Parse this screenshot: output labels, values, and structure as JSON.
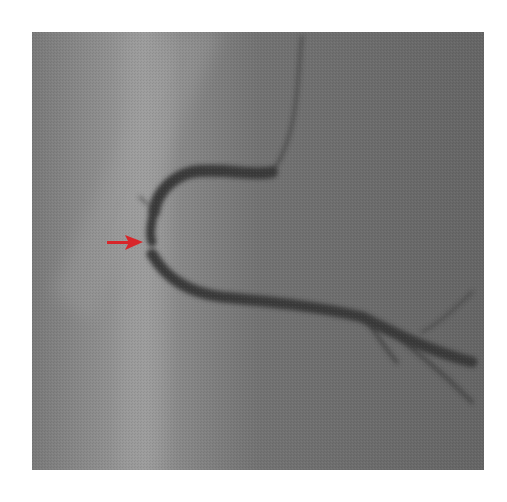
{
  "image": {
    "description": "Coronary angiogram (grayscale X-ray) with red arrow indicating a lesion",
    "colors": {
      "background": "#ffffff",
      "film": "#6e6e6e",
      "vessel": "#3a3a3a",
      "arrow": "#d8262a"
    },
    "annotation": {
      "type": "arrow",
      "direction": "right",
      "color": "#d8262a"
    }
  }
}
